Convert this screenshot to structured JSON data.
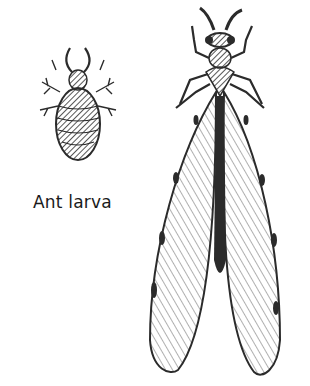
{
  "illustration": {
    "caption": "Ant larva",
    "ink_color": "#2b2b2b",
    "background": "#ffffff",
    "subjects": [
      {
        "name": "ant-larva",
        "description": "bristly oval larva with pincers"
      },
      {
        "name": "adult-antlion",
        "description": "winged adult with long veined wings"
      }
    ]
  }
}
